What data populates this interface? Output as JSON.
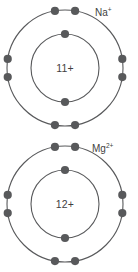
{
  "figure": {
    "background_color": "#ffffff",
    "stroke_color": "#58595b",
    "text_color": "#3f3f41",
    "electron_color": "#58595b"
  },
  "atoms": [
    {
      "id": "sodium-ion",
      "ion_symbol": "Na",
      "ion_charge": "+",
      "ion_label": "Na+",
      "nucleus_charge": "11+",
      "center": {
        "x": 65,
        "y": 68
      },
      "shells": [
        {
          "name": "inner-shell",
          "radius": 34,
          "electron_count": 2,
          "electron_angles_deg": [
            270,
            90
          ]
        },
        {
          "name": "outer-shell",
          "radius": 58,
          "electron_count": 8,
          "electron_angles_deg": [
            260,
            280,
            80,
            100,
            171,
            189,
            351,
            9
          ]
        }
      ]
    },
    {
      "id": "magnesium-ion",
      "ion_symbol": "Mg",
      "ion_charge": "2+",
      "ion_label": "Mg2+",
      "nucleus_charge": "12+",
      "center": {
        "x": 65,
        "y": 68
      },
      "shells": [
        {
          "name": "inner-shell",
          "radius": 34,
          "electron_count": 2,
          "electron_angles_deg": [
            270,
            90
          ]
        },
        {
          "name": "outer-shell",
          "radius": 58,
          "electron_count": 8,
          "electron_angles_deg": [
            260,
            280,
            80,
            100,
            171,
            189,
            351,
            9
          ]
        }
      ]
    }
  ]
}
